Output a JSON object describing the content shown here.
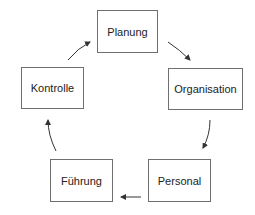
{
  "diagram": {
    "type": "cycle",
    "nodes": [
      {
        "id": "planung",
        "label": "Planung"
      },
      {
        "id": "organisation",
        "label": "Organisation"
      },
      {
        "id": "personal",
        "label": "Personal"
      },
      {
        "id": "fuehrung",
        "label": "Führung"
      },
      {
        "id": "kontrolle",
        "label": "Kontrolle"
      }
    ],
    "edges": [
      {
        "from": "planung",
        "to": "organisation"
      },
      {
        "from": "organisation",
        "to": "personal"
      },
      {
        "from": "personal",
        "to": "fuehrung"
      },
      {
        "from": "fuehrung",
        "to": "kontrolle"
      },
      {
        "from": "kontrolle",
        "to": "planung"
      }
    ],
    "colors": {
      "border": "#6f6f6f",
      "text": "#222222",
      "arrow": "#333333"
    }
  }
}
